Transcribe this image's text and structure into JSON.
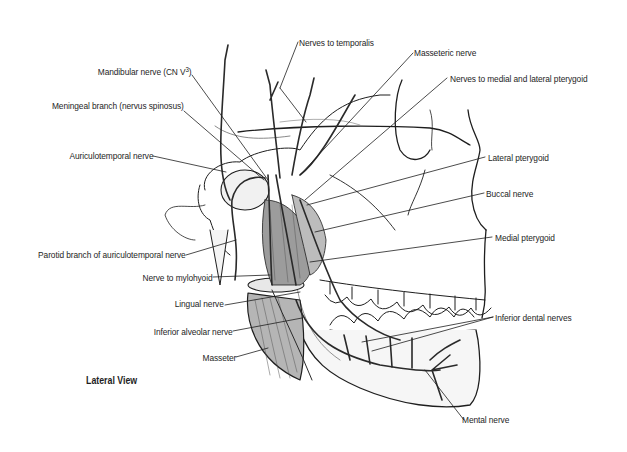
{
  "figure": {
    "caption": "Lateral View",
    "colors": {
      "ink": "#1e1e1e",
      "shade": "#d9d9d9",
      "muscle": "#8a8a8a",
      "paper": "#ffffff"
    }
  },
  "labels_left": [
    {
      "id": "mandibular-nerve",
      "text": "Mandibular nerve (CN V",
      "sup": "3",
      "suffix": ")"
    },
    {
      "id": "meningeal-branch",
      "text": "Meningeal branch (nervus spinosus)"
    },
    {
      "id": "auriculotemporal-nerve",
      "text": "Auriculotemporal nerve"
    },
    {
      "id": "parotid-branch",
      "text": "Parotid branch of auriculotemporal nerve"
    },
    {
      "id": "nerve-to-mylohyoid",
      "text": "Nerve to mylohyoid"
    },
    {
      "id": "lingual-nerve",
      "text": "Lingual nerve"
    },
    {
      "id": "inferior-alveolar-nerve",
      "text": "Inferior alveolar nerve"
    },
    {
      "id": "masseter",
      "text": "Masseter"
    }
  ],
  "labels_right": [
    {
      "id": "nerves-to-temporalis",
      "text": "Nerves to temporalis"
    },
    {
      "id": "masseteric-nerve",
      "text": "Masseteric nerve"
    },
    {
      "id": "nerves-to-pterygoid",
      "text": "Nerves to medial and lateral pterygoid"
    },
    {
      "id": "lateral-pterygoid",
      "text": "Lateral pterygoid"
    },
    {
      "id": "buccal-nerve",
      "text": "Buccal nerve"
    },
    {
      "id": "medial-pterygoid",
      "text": "Medial pterygoid"
    },
    {
      "id": "inferior-dental-nerves",
      "text": "Inferior dental nerves"
    },
    {
      "id": "mental-nerve",
      "text": "Mental nerve"
    }
  ]
}
